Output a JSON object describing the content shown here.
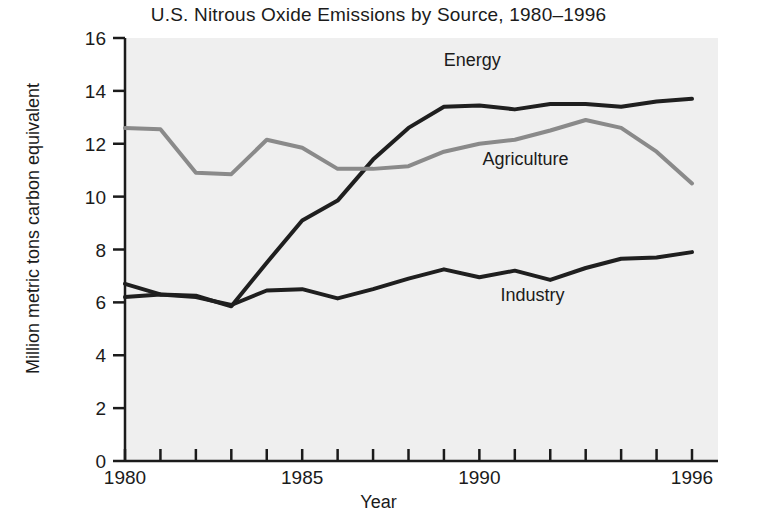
{
  "chart_data": {
    "type": "line",
    "title": "U.S. Nitrous Oxide Emissions by Source, 1980–1996",
    "xlabel": "Year",
    "ylabel": "Million metric tons carbon equivalent",
    "grid": false,
    "legend_position": "inline-annotations",
    "xlim": [
      1980,
      1996
    ],
    "ylim": [
      0,
      16
    ],
    "yticks": [
      0,
      2,
      4,
      6,
      8,
      10,
      12,
      14,
      16
    ],
    "ytick_labels": [
      "0",
      "2",
      "4",
      "6",
      "8",
      "10",
      "12",
      "14",
      "16"
    ],
    "xticks": [
      1980,
      1981,
      1982,
      1983,
      1984,
      1985,
      1986,
      1987,
      1988,
      1989,
      1990,
      1991,
      1992,
      1993,
      1994,
      1995,
      1996
    ],
    "xtick_labels_shown": [
      "1980",
      "1985",
      "1990",
      "1996"
    ],
    "x": [
      1980,
      1981,
      1982,
      1983,
      1984,
      1985,
      1986,
      1987,
      1988,
      1989,
      1990,
      1991,
      1992,
      1993,
      1994,
      1995,
      1996
    ],
    "series": [
      {
        "name": "Energy",
        "color": "#1f1f1f",
        "values": [
          6.7,
          6.3,
          6.25,
          5.85,
          7.5,
          9.1,
          9.85,
          11.4,
          12.6,
          13.4,
          13.45,
          13.3,
          13.5,
          13.5,
          13.4,
          13.6,
          13.7
        ]
      },
      {
        "name": "Agriculture",
        "color": "#8a8a8a",
        "values": [
          12.6,
          12.55,
          10.9,
          10.85,
          12.15,
          11.85,
          11.05,
          11.05,
          11.15,
          11.7,
          12.0,
          12.15,
          12.5,
          12.9,
          12.6,
          11.7,
          10.5
        ]
      },
      {
        "name": "Industry",
        "color": "#1f1f1f",
        "values": [
          6.2,
          6.3,
          6.2,
          5.9,
          6.45,
          6.5,
          6.15,
          6.5,
          6.9,
          7.25,
          6.95,
          7.2,
          6.85,
          7.3,
          7.65,
          7.7,
          7.9
        ]
      }
    ],
    "annotations": [
      {
        "text": "Energy",
        "x": 1989.8,
        "y": 14.95
      },
      {
        "text": "Agriculture",
        "x": 1991.3,
        "y": 11.2
      },
      {
        "text": "Industry",
        "x": 1991.5,
        "y": 6.05
      }
    ]
  }
}
